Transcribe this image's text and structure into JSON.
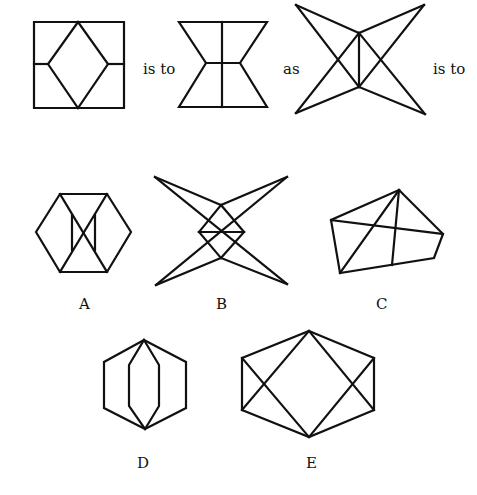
{
  "analogy": {
    "connector_1": "is to",
    "connector_2": "as",
    "connector_3": "is to"
  },
  "options": [
    {
      "label": "A"
    },
    {
      "label": "B"
    },
    {
      "label": "C"
    },
    {
      "label": "D"
    },
    {
      "label": "E"
    }
  ]
}
